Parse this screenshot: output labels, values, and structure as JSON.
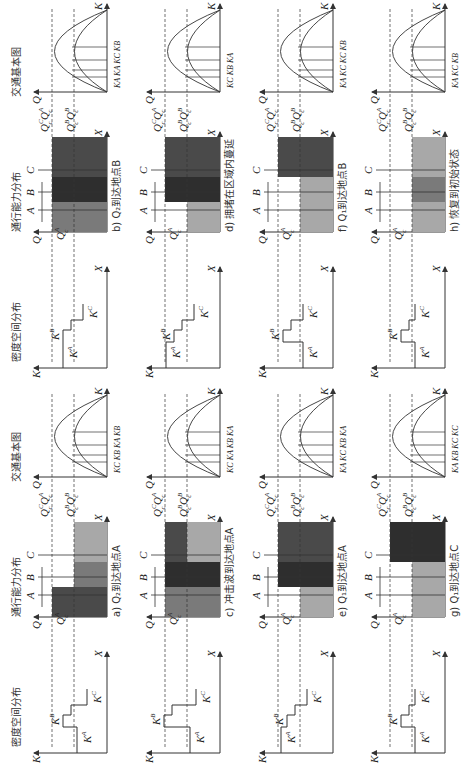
{
  "figure": {
    "column_headers": {
      "density": "密度空间分布",
      "capacity": "通行能力分布",
      "fundamental": "交通基本图"
    },
    "axis_labels": {
      "K": "K",
      "X": "X",
      "Q": "Q"
    },
    "segments": [
      "A",
      "B",
      "C"
    ],
    "capacity_labels": {
      "QcA": "Q",
      "QcB": "Q",
      "QcC": "Q",
      "QcAC": "Q",
      "sub": "c"
    },
    "colors": {
      "dark": "#4a4a4a",
      "darker": "#2e2e2e",
      "mid": "#7a7a7a",
      "light": "#a8a8a8",
      "line": "#333333"
    },
    "panels": [
      {
        "id": "a",
        "caption": "a) Q₂到达地点A",
        "k_labels": [
          "K^A",
          "K^B",
          "K^C"
        ],
        "kd_labels": "K^C K^B K^A K^B"
      },
      {
        "id": "b",
        "caption": "b) Q₂到达地点B",
        "k_labels": [
          "K^A",
          "K^B",
          "K^C"
        ],
        "kd_labels": "K^A K^A K^C K^B"
      },
      {
        "id": "c",
        "caption": "c) 冲击波到达地点A",
        "k_labels": [
          "K^A",
          "K^B",
          "K^C"
        ],
        "kd_labels": "K^C K^A K^B K^A"
      },
      {
        "id": "d",
        "caption": "d) 拥堵在区域内蔓延",
        "k_labels": [
          "K^A",
          "K^B",
          "K^C"
        ],
        "kd_labels": "K^C K^B K^A"
      },
      {
        "id": "e",
        "caption": "e) Q₁到达地点A",
        "k_labels": [
          "K^A",
          "K^B",
          "K^C"
        ],
        "kd_labels": "K^A K^C K^B K^A"
      },
      {
        "id": "f",
        "caption": "f) Q₁到达地点B",
        "k_labels": [
          "K^A",
          "K^B",
          "K^C"
        ],
        "kd_labels": "K^A K^C K^C K^B"
      },
      {
        "id": "g",
        "caption": "g) Q₁到达地点C",
        "k_labels": [
          "K^A",
          "K^B",
          "K^C"
        ],
        "kd_labels": "K^A K^B K^C K^C"
      },
      {
        "id": "h",
        "caption": "h) 恢复到初始状态",
        "k_labels": [
          "K^A",
          "K^B",
          "K^C"
        ],
        "kd_labels": "K^A K^C K^B"
      }
    ]
  }
}
